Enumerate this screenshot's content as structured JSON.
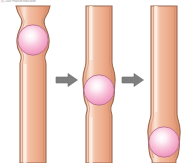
{
  "figure": {
    "title_credit": "(c) 2003 Pearson Education",
    "background_color": "#ffffff",
    "type": "biological-process-sequence",
    "stage_count": 3,
    "arrow_count": 2
  },
  "colors": {
    "tube_fill_light": "#f6cdb6",
    "tube_fill_mid": "#eaa482",
    "tube_fill_dark": "#d98a66",
    "tube_highlight": "#fce6da",
    "tube_outline": "#9c6a50",
    "tube_outline_inner": "#c08a6c",
    "bubble_center": "#ffffff",
    "bubble_mid": "#f8b9d2",
    "bubble_edge": "#ef8fb8",
    "bubble_outline": "#b06a80",
    "arrow_fill": "#7f7f7f",
    "arrow_outline": "#6b6b6b"
  },
  "panels": [
    {
      "id": "panel-1",
      "label": "stage-1",
      "bubble_position": "top",
      "bubble_center_y": 40,
      "bubble_radius": 15,
      "tube_top_flared": true
    },
    {
      "id": "panel-2",
      "label": "stage-2",
      "bubble_position": "middle",
      "bubble_center_y": 90,
      "bubble_radius": 15,
      "tube_top_flared": false
    },
    {
      "id": "panel-3",
      "label": "stage-3",
      "bubble_position": "bottom",
      "bubble_center_y": 142,
      "bubble_radius": 15,
      "tube_top_flared": false
    }
  ],
  "arrows": [
    {
      "id": "arrow-1",
      "direction": "right",
      "x": 55,
      "y": 72
    },
    {
      "id": "arrow-2",
      "direction": "right",
      "x": 121,
      "y": 72
    }
  ]
}
